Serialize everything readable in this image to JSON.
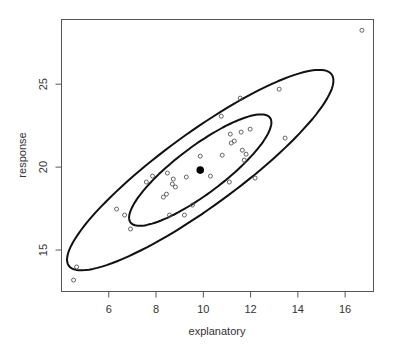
{
  "chart_data": {
    "type": "scatter",
    "title": "",
    "xlabel": "explanatory",
    "ylabel": "response",
    "xlim": [
      4.0,
      17.2
    ],
    "ylim": [
      12.5,
      28.9
    ],
    "x_ticks": [
      6,
      8,
      10,
      12,
      14,
      16
    ],
    "y_ticks": [
      15,
      20,
      25
    ],
    "x_tick_labels": [
      "6",
      "8",
      "10",
      "12",
      "14",
      "16"
    ],
    "y_tick_labels": [
      "15",
      "20",
      "25"
    ],
    "grid": false,
    "legend": null,
    "series": [
      {
        "name": "observations",
        "marker": "open-circle",
        "color": "#555555",
        "points": [
          [
            4.64,
            13.98
          ],
          [
            4.51,
            13.19
          ],
          [
            6.33,
            17.47
          ],
          [
            6.67,
            17.11
          ],
          [
            6.92,
            16.27
          ],
          [
            7.59,
            19.1
          ],
          [
            7.85,
            19.46
          ],
          [
            8.48,
            19.64
          ],
          [
            8.73,
            19.28
          ],
          [
            8.69,
            18.98
          ],
          [
            8.82,
            18.8
          ],
          [
            8.31,
            18.19
          ],
          [
            8.44,
            18.37
          ],
          [
            9.28,
            19.4
          ],
          [
            9.87,
            20.66
          ],
          [
            10.3,
            19.46
          ],
          [
            9.54,
            17.71
          ],
          [
            9.2,
            17.11
          ],
          [
            8.57,
            17.11
          ],
          [
            10.76,
            23.07
          ],
          [
            10.8,
            20.72
          ],
          [
            11.1,
            19.1
          ],
          [
            11.14,
            21.99
          ],
          [
            11.18,
            21.45
          ],
          [
            11.31,
            21.57
          ],
          [
            11.56,
            24.16
          ],
          [
            11.6,
            22.11
          ],
          [
            11.65,
            21.02
          ],
          [
            11.98,
            22.29
          ],
          [
            11.73,
            20.42
          ],
          [
            11.81,
            20.78
          ],
          [
            12.19,
            19.34
          ],
          [
            13.21,
            24.7
          ],
          [
            13.46,
            21.75
          ],
          [
            16.71,
            28.25
          ]
        ]
      },
      {
        "name": "mean",
        "marker": "filled-circle",
        "color": "#000000",
        "points": [
          [
            9.87,
            19.82
          ]
        ]
      }
    ],
    "ellipses": [
      {
        "name": "inner-contour",
        "center": [
          9.87,
          19.82
        ],
        "major_vector": [
          2.95,
          3.16
        ],
        "minor_vector": [
          0.6,
          -1.14
        ],
        "color": "#111111"
      },
      {
        "name": "outer-contour",
        "center": [
          9.87,
          19.82
        ],
        "major_vector": [
          5.56,
          5.77
        ],
        "minor_vector": [
          0.92,
          -1.8
        ],
        "color": "#111111"
      }
    ]
  }
}
